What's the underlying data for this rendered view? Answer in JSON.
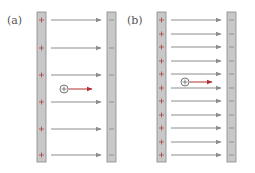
{
  "panels": [
    {
      "label": "(a)",
      "left_plate": {
        "x": 37,
        "width": 9,
        "sign": "+"
      },
      "right_plate": {
        "x": 107,
        "width": 9,
        "sign": "−"
      },
      "field_lines_y": [
        20,
        48,
        75,
        102,
        129,
        155
      ],
      "charge": {
        "symbol": "+",
        "cx": 64,
        "cy": 89,
        "arrow_end_x": 92
      }
    },
    {
      "label": "(b)",
      "left_plate": {
        "x": 157,
        "width": 9,
        "sign": "+"
      },
      "right_plate": {
        "x": 227,
        "width": 9,
        "sign": "−"
      },
      "field_lines_y": [
        20,
        34,
        47,
        61,
        74,
        88,
        101,
        115,
        128,
        142,
        155
      ],
      "charge": {
        "symbol": "+",
        "cx": 185,
        "cy": 82,
        "arrow_end_x": 212
      }
    }
  ],
  "colors": {
    "plate_fill": "#c8c8c8",
    "plate_edge": "#888888",
    "plus_sign": "#b05050",
    "minus_sign": "#8a8a8a",
    "field_line": "#8c8c8c",
    "force_arrow": "#b03030",
    "charge_circle": "#555555"
  },
  "plate_top": 12,
  "plate_bottom": 162
}
